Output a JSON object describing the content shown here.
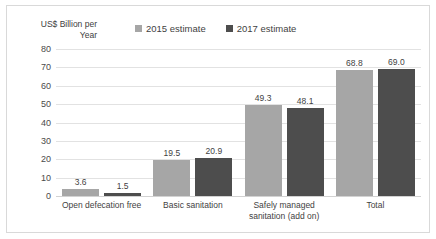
{
  "chart_data": {
    "type": "bar",
    "title": "",
    "subtitle": "",
    "xlabel": "",
    "ylabel": "US$ Billion per\nYear",
    "ylim": [
      0,
      80
    ],
    "yticks": [
      "80",
      "70",
      "60",
      "50",
      "40",
      "30",
      "20",
      "10",
      "0"
    ],
    "grid": true,
    "legend_position": "top-center",
    "categories": [
      "Open defecation free",
      "Basic sanitation",
      "Safely managed\nsanitation (add on)",
      "Total"
    ],
    "series": [
      {
        "name": "2015 estimate",
        "color": "#a6a6a6",
        "values": [
          3.6,
          19.5,
          49.3,
          68.8
        ],
        "labels": [
          "3.6",
          "19.5",
          "49.3",
          "68.8"
        ]
      },
      {
        "name": "2017 estimate",
        "color": "#4d4d4d",
        "values": [
          1.5,
          20.9,
          48.1,
          69.0
        ],
        "labels": [
          "1.5",
          "20.9",
          "48.1",
          "69.0"
        ]
      }
    ]
  },
  "legend": {
    "items": [
      {
        "label": "2015 estimate",
        "color": "#a6a6a6"
      },
      {
        "label": "2017 estimate",
        "color": "#4d4d4d"
      }
    ]
  },
  "axis": {
    "y_title": "US$ Billion per\nYear"
  }
}
